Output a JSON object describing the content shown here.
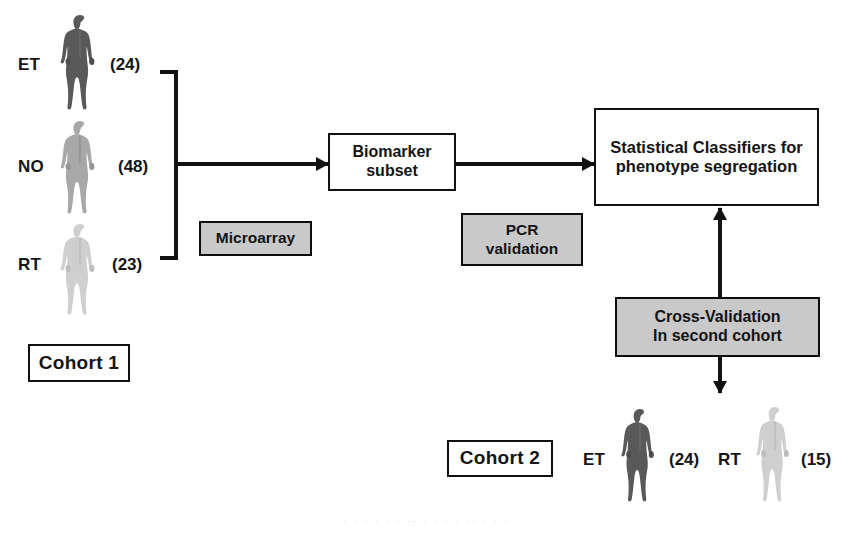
{
  "diagram": {
    "colors": {
      "line": "#121212",
      "gray_box_fill": "#c9c9c9",
      "white_box_fill": "#ffffff",
      "person_dark": "#595959",
      "person_mid": "#a8a8a8",
      "person_light": "#cfcfcf"
    }
  },
  "cohort1": {
    "label": "Cohort 1",
    "groups": [
      {
        "code": "ET",
        "count": "(24)",
        "shade": "dark",
        "icon": "person-icon"
      },
      {
        "code": "NO",
        "count": "(48)",
        "shade": "mid",
        "icon": "person-icon"
      },
      {
        "code": "RT",
        "count": "(23)",
        "shade": "light",
        "icon": "person-icon"
      }
    ]
  },
  "cohort2": {
    "label": "Cohort 2",
    "groups": [
      {
        "code": "ET",
        "count": "(24)",
        "shade": "dark",
        "icon": "person-icon"
      },
      {
        "code": "RT",
        "count": "(15)",
        "shade": "light",
        "icon": "person-icon"
      }
    ]
  },
  "process_boxes": {
    "biomarker": {
      "line1": "Biomarker",
      "line2": "subset"
    },
    "classifier": {
      "line1": "Statistical Classifiers for",
      "line2": "phenotype segregation"
    }
  },
  "method_boxes": {
    "microarray": {
      "line1": "Microarray"
    },
    "pcr": {
      "line1": "PCR",
      "line2": "validation"
    },
    "crossval": {
      "line1": "Cross-Validation",
      "line2": "In second cohort"
    }
  },
  "connectors": {
    "bracket_to_biomarker": "arrow-right",
    "biomarker_to_classifier": "arrow-right",
    "crossval_to_classifier": "arrow-up",
    "crossval_to_cohort2": "arrow-down",
    "cohort1_bracket": "curly-bracket"
  },
  "artifact_text": "· · ·  · ·  ·  ·· ·  ·  · ·  ··  · ·  ·"
}
